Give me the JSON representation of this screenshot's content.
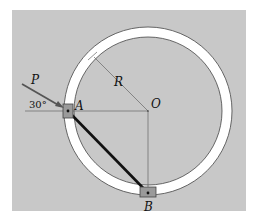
{
  "diagram": {
    "labels": {
      "force": "P",
      "angle": "30°",
      "point_a": "A",
      "point_b": "B",
      "center": "O",
      "radius": "R"
    },
    "colors": {
      "panel": "#c8c8c8",
      "ring": "#ffffff",
      "rod": "#111111",
      "slider": "#9a9a9a",
      "line": "#555555"
    }
  }
}
